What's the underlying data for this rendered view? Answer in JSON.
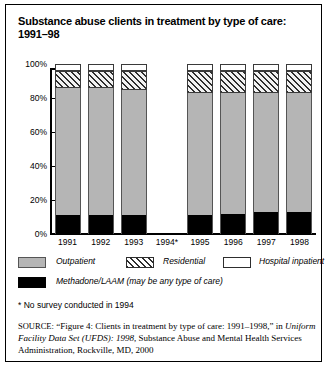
{
  "title": "Substance abuse clients in treatment by type of care: 1991–98",
  "footnote": "* No survey conducted in 1994",
  "source": {
    "lead": "SOURCE:",
    "part1": " “Figure 4: Clients in treatment by type of care: 1991–1998,” in ",
    "italic": "Uniform Facility Data Set (UFDS): 1998",
    "part2": ", Substance Abuse and Mental Health Services Administration, Rockville, MD, 2000"
  },
  "legend": {
    "outpatient": "Outpatient",
    "residential": "Residential",
    "hospital": "Hospital inpatient",
    "methadone": "Methadone/LAAM (may be any type of care)"
  },
  "colors": {
    "outpatient": "#b5b5b5",
    "residential": "#2e2e2e",
    "hospital": "#ffffff",
    "methadone": "#000000",
    "frame": "#000000"
  },
  "chart_data": {
    "type": "bar",
    "title": "Substance abuse clients in treatment by type of care: 1991–98",
    "xlabel": "",
    "ylabel": "",
    "ylim": [
      0,
      100
    ],
    "yticks": [
      "0%",
      "20%",
      "40%",
      "60%",
      "80%",
      "100%"
    ],
    "ytick_values": [
      0,
      20,
      40,
      60,
      80,
      100
    ],
    "grid": false,
    "legend_position": "below",
    "stacked": true,
    "categories": [
      "1991",
      "1992",
      "1993",
      "1994*",
      "1995",
      "1996",
      "1997",
      "1998"
    ],
    "series": [
      {
        "name": "Outpatient",
        "values": [
          86,
          86,
          85,
          null,
          83,
          83,
          83,
          83
        ]
      },
      {
        "name": "Residential",
        "values": [
          10,
          10,
          11,
          null,
          13,
          13,
          13,
          13
        ]
      },
      {
        "name": "Hospital inpatient",
        "values": [
          4,
          4,
          4,
          null,
          4,
          4,
          4,
          4
        ]
      },
      {
        "name": "Methadone/LAAM",
        "values": [
          11,
          11,
          11,
          null,
          11,
          12,
          13,
          13
        ]
      }
    ]
  }
}
